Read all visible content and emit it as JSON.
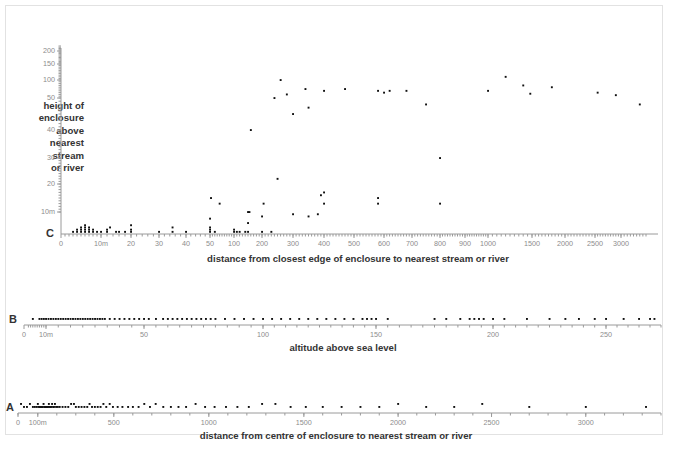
{
  "figure": {
    "panels": [
      "C",
      "B",
      "A"
    ],
    "marker_color": "#111111",
    "axis_color": "#9a9a9a",
    "label_color": "#333333"
  },
  "panelC": {
    "letter": "C",
    "ylabel": "height of enclosure above nearest stream or river",
    "ylabel_lines": [
      "height of",
      "enclosure",
      "above",
      "nearest",
      "stream",
      "or river"
    ],
    "xlabel": "distance from closest edge of enclosure to nearest stream or river",
    "x_ticks": [
      "0",
      "10m",
      "20",
      "30",
      "40",
      "50",
      "100",
      "200",
      "300",
      "400",
      "500",
      "600",
      "700",
      "800",
      "900",
      "1000",
      "1500",
      "2000",
      "2500",
      "3000"
    ],
    "y_ticks": [
      "10m",
      "20",
      "30",
      "40",
      "50",
      "100",
      "150",
      "200"
    ]
  },
  "panelB": {
    "letter": "B",
    "xlabel": "altitude above sea level",
    "x_ticks": [
      "0",
      "10m",
      "50",
      "100",
      "150",
      "200",
      "250"
    ]
  },
  "panelA": {
    "letter": "A",
    "xlabel": "distance from centre of enclosure to nearest stream or river",
    "x_ticks": [
      "0",
      "100m",
      "500",
      "1000",
      "1500",
      "2000",
      "2500",
      "3000"
    ]
  },
  "chart_data": [
    {
      "type": "scatter",
      "panel": "C",
      "title": "",
      "xlabel": "distance from closest edge of enclosure to nearest stream or river",
      "ylabel": "height of enclosure above nearest stream or river",
      "xscale": "log-segmented",
      "yscale": "log-segmented",
      "xlim": [
        0,
        3400
      ],
      "ylim": [
        0,
        220
      ],
      "xtick_values": [
        0,
        10,
        20,
        30,
        40,
        50,
        100,
        200,
        300,
        400,
        500,
        600,
        700,
        800,
        900,
        1000,
        1500,
        2000,
        2500,
        3000
      ],
      "xtick_labels": [
        "0",
        "10m",
        "20",
        "30",
        "40",
        "50",
        "100",
        "200",
        "300",
        "400",
        "500",
        "600",
        "700",
        "800",
        "900",
        "1000",
        "1500",
        "2000",
        "2500",
        "3000"
      ],
      "ytick_values": [
        10,
        20,
        30,
        40,
        50,
        100,
        150,
        200
      ],
      "ytick_labels": [
        "10m",
        "20",
        "30",
        "40",
        "50",
        "100",
        "150",
        "200"
      ],
      "grid": false,
      "legend": "none",
      "points": [
        [
          3,
          1
        ],
        [
          4,
          1
        ],
        [
          4,
          2
        ],
        [
          5,
          1
        ],
        [
          5,
          2
        ],
        [
          5,
          3
        ],
        [
          6,
          1
        ],
        [
          6,
          2
        ],
        [
          6,
          3
        ],
        [
          6,
          4
        ],
        [
          7,
          1
        ],
        [
          7,
          2
        ],
        [
          7,
          3
        ],
        [
          8,
          1
        ],
        [
          8,
          2
        ],
        [
          9,
          1
        ],
        [
          10,
          1
        ],
        [
          12,
          1
        ],
        [
          12,
          2
        ],
        [
          13,
          3
        ],
        [
          15,
          1
        ],
        [
          16,
          1
        ],
        [
          18,
          1
        ],
        [
          20,
          1
        ],
        [
          20,
          2
        ],
        [
          20,
          4
        ],
        [
          30,
          1
        ],
        [
          35,
          1
        ],
        [
          35,
          3
        ],
        [
          40,
          1
        ],
        [
          50,
          1
        ],
        [
          50,
          2
        ],
        [
          50,
          3
        ],
        [
          50,
          7
        ],
        [
          52,
          15
        ],
        [
          60,
          1
        ],
        [
          70,
          13
        ],
        [
          100,
          1
        ],
        [
          100,
          2
        ],
        [
          110,
          1
        ],
        [
          120,
          1
        ],
        [
          140,
          1
        ],
        [
          150,
          1
        ],
        [
          150,
          5
        ],
        [
          150,
          10
        ],
        [
          155,
          10
        ],
        [
          160,
          40
        ],
        [
          200,
          1
        ],
        [
          200,
          8
        ],
        [
          205,
          13
        ],
        [
          230,
          1
        ],
        [
          240,
          50
        ],
        [
          250,
          22
        ],
        [
          260,
          100
        ],
        [
          280,
          60
        ],
        [
          300,
          9
        ],
        [
          300,
          45
        ],
        [
          340,
          75
        ],
        [
          350,
          8
        ],
        [
          350,
          47
        ],
        [
          380,
          9
        ],
        [
          390,
          16
        ],
        [
          400,
          17
        ],
        [
          400,
          13
        ],
        [
          400,
          70
        ],
        [
          470,
          75
        ],
        [
          580,
          70
        ],
        [
          580,
          15
        ],
        [
          580,
          13
        ],
        [
          600,
          65
        ],
        [
          620,
          70
        ],
        [
          680,
          70
        ],
        [
          750,
          48
        ],
        [
          800,
          30
        ],
        [
          800,
          13
        ],
        [
          1000,
          70
        ],
        [
          1200,
          110
        ],
        [
          1400,
          85
        ],
        [
          1480,
          62
        ],
        [
          1800,
          80
        ],
        [
          2550,
          65
        ],
        [
          2900,
          58
        ],
        [
          3300,
          48
        ]
      ]
    },
    {
      "type": "scatter",
      "panel": "B",
      "title": "",
      "xlabel": "altitude above sea level",
      "ylabel": "",
      "xscale": "log-segmented",
      "xlim": [
        0,
        275
      ],
      "xtick_values": [
        0,
        10,
        50,
        100,
        150,
        200,
        250
      ],
      "xtick_labels": [
        "0",
        "10m",
        "50",
        "100",
        "150",
        "200",
        "250"
      ],
      "grid": false,
      "legend": "none",
      "values": [
        4,
        7,
        8,
        9,
        10,
        11,
        12,
        13,
        14,
        15,
        16,
        17,
        18,
        19,
        20,
        21,
        22,
        23,
        24,
        25,
        26,
        27,
        28,
        29,
        30,
        31,
        32,
        33,
        34,
        36,
        38,
        40,
        42,
        44,
        46,
        48,
        50,
        52,
        55,
        58,
        60,
        62,
        64,
        66,
        68,
        70,
        72,
        74,
        76,
        78,
        80,
        84,
        88,
        92,
        96,
        100,
        104,
        108,
        112,
        116,
        120,
        124,
        128,
        132,
        136,
        140,
        144,
        146,
        148,
        150,
        155,
        175,
        180,
        186,
        190,
        192,
        194,
        196,
        200,
        205,
        215,
        225,
        232,
        238,
        245,
        250,
        258,
        265,
        270,
        272
      ]
    },
    {
      "type": "scatter",
      "panel": "A",
      "title": "",
      "xlabel": "distance from centre of enclosure to nearest stream or river",
      "ylabel": "",
      "xscale": "linear",
      "xlim": [
        0,
        3400
      ],
      "xtick_values": [
        0,
        100,
        500,
        1000,
        1500,
        2000,
        2500,
        3000
      ],
      "xtick_labels": [
        "0",
        "100m",
        "500",
        "1000",
        "1500",
        "2000",
        "2500",
        "3000"
      ],
      "grid": false,
      "legend": "none",
      "values": [
        15,
        30,
        45,
        60,
        75,
        85,
        95,
        100,
        105,
        110,
        115,
        118,
        122,
        126,
        130,
        134,
        138,
        142,
        146,
        150,
        154,
        158,
        162,
        166,
        170,
        175,
        180,
        185,
        190,
        196,
        205,
        215,
        230,
        245,
        260,
        275,
        290,
        300,
        315,
        330,
        345,
        360,
        372,
        385,
        400,
        415,
        430,
        445,
        460,
        478,
        495,
        520,
        545,
        575,
        600,
        630,
        660,
        690,
        720,
        760,
        800,
        840,
        880,
        930,
        980,
        1030,
        1090,
        1150,
        1210,
        1280,
        1350,
        1430,
        1510,
        1600,
        1700,
        1800,
        1900,
        2000,
        2150,
        2300,
        2450,
        2700,
        3000,
        3320
      ]
    }
  ]
}
